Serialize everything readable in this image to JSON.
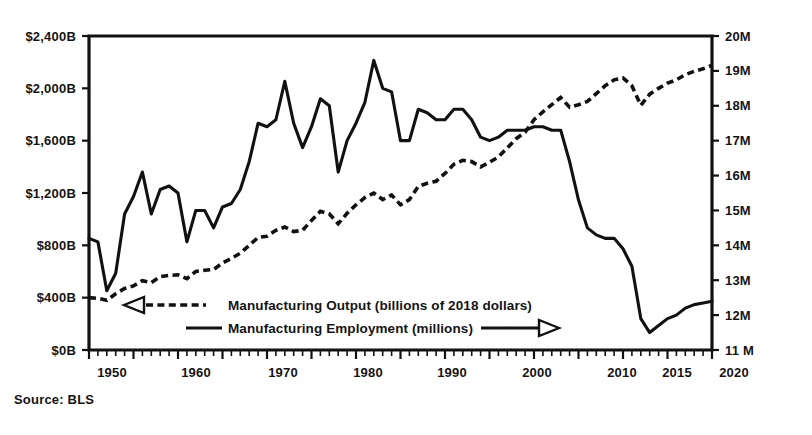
{
  "source_note": "Source: BLS",
  "legend": {
    "position": "inside-bottom-left",
    "entries": [
      {
        "label": "Manufacturing Output (billions of 2018 dollars)",
        "style": "dashed",
        "axis": "left",
        "arrow": "left"
      },
      {
        "label": "Manufacturing Employment (millions)",
        "style": "solid",
        "axis": "right",
        "arrow": "right"
      }
    ]
  },
  "axes": {
    "left": {
      "title": "",
      "ticks": [
        "$2,400B",
        "$2,000B",
        "$1,600B",
        "$1,200B",
        "$800B",
        "$400B",
        "$0B"
      ],
      "values": [
        2400,
        2000,
        1600,
        1200,
        800,
        400,
        0
      ],
      "range": [
        0,
        2400
      ]
    },
    "right": {
      "title": "",
      "ticks": [
        "20M",
        "19M",
        "18M",
        "17M",
        "16M",
        "15M",
        "14M",
        "13M",
        "12M",
        "11 M"
      ],
      "values": [
        20,
        19,
        18,
        17,
        16,
        15,
        14,
        13,
        12,
        11
      ],
      "range": [
        11,
        20
      ]
    },
    "bottom": {
      "ticks": [
        "1950",
        "1960",
        "1970",
        "1980",
        "1990",
        "2000",
        "2010",
        "2015",
        "2020"
      ],
      "values": [
        1950,
        1960,
        1970,
        1980,
        1990,
        2000,
        2010,
        2015,
        2020
      ],
      "range": [
        1947,
        2020
      ]
    }
  },
  "chart_data": {
    "type": "line",
    "title": "",
    "subtitle": "",
    "xlabel": "",
    "ylabel": "Manufacturing Output (billions of 2018 dollars)",
    "y2label": "Manufacturing Employment (millions)",
    "xlim": [
      1947,
      2020
    ],
    "ylim": [
      0,
      2400
    ],
    "y2lim": [
      11,
      20
    ],
    "grid": false,
    "legend_position": "inside-bottom-left",
    "source": "Source: BLS",
    "series": [
      {
        "name": "Manufacturing Output (billions of 2018 dollars)",
        "style": "dashed",
        "axis": "left",
        "units": "billions of 2018 dollars",
        "x": [
          1947,
          1948,
          1949,
          1950,
          1951,
          1952,
          1953,
          1954,
          1955,
          1956,
          1957,
          1958,
          1959,
          1960,
          1961,
          1962,
          1963,
          1964,
          1965,
          1966,
          1967,
          1968,
          1969,
          1970,
          1971,
          1972,
          1973,
          1974,
          1975,
          1976,
          1977,
          1978,
          1979,
          1980,
          1981,
          1982,
          1983,
          1984,
          1985,
          1986,
          1987,
          1988,
          1989,
          1990,
          1991,
          1992,
          1993,
          1994,
          1995,
          1996,
          1997,
          1998,
          1999,
          2000,
          2001,
          2002,
          2003,
          2004,
          2005,
          2006,
          2007,
          2008,
          2009,
          2010,
          2011,
          2012,
          2013,
          2014,
          2015,
          2016,
          2017
        ],
        "y": [
          400,
          395,
          380,
          430,
          470,
          490,
          530,
          515,
          560,
          570,
          575,
          545,
          600,
          610,
          615,
          665,
          700,
          740,
          800,
          860,
          870,
          915,
          940,
          905,
          915,
          990,
          1060,
          1040,
          965,
          1045,
          1110,
          1165,
          1200,
          1150,
          1185,
          1110,
          1150,
          1250,
          1275,
          1290,
          1350,
          1420,
          1450,
          1440,
          1400,
          1435,
          1475,
          1545,
          1615,
          1665,
          1760,
          1820,
          1875,
          1930,
          1855,
          1875,
          1900,
          1960,
          2020,
          2065,
          2080,
          2020,
          1870,
          1955,
          2000,
          2040,
          2065,
          2105,
          2130,
          2150,
          2175
        ]
      },
      {
        "name": "Manufacturing Employment (millions)",
        "style": "solid",
        "axis": "right",
        "units": "millions",
        "x": [
          1947,
          1948,
          1949,
          1950,
          1951,
          1952,
          1953,
          1954,
          1955,
          1956,
          1957,
          1958,
          1959,
          1960,
          1961,
          1962,
          1963,
          1964,
          1965,
          1966,
          1967,
          1968,
          1969,
          1970,
          1971,
          1972,
          1973,
          1974,
          1975,
          1976,
          1977,
          1978,
          1979,
          1980,
          1981,
          1982,
          1983,
          1984,
          1985,
          1986,
          1987,
          1988,
          1989,
          1990,
          1991,
          1992,
          1993,
          1994,
          1995,
          1996,
          1997,
          1998,
          1999,
          2000,
          2001,
          2002,
          2003,
          2004,
          2005,
          2006,
          2007,
          2008,
          2009,
          2010,
          2011,
          2012,
          2013,
          2014,
          2015,
          2016,
          2017
        ],
        "y": [
          14.2,
          14.1,
          12.7,
          13.2,
          14.9,
          15.4,
          16.1,
          14.9,
          15.6,
          15.7,
          15.5,
          14.1,
          15.0,
          15.0,
          14.5,
          15.1,
          15.2,
          15.6,
          16.4,
          17.5,
          17.4,
          17.6,
          18.7,
          17.5,
          16.8,
          17.4,
          18.2,
          18.0,
          16.1,
          17.0,
          17.5,
          18.1,
          19.3,
          18.5,
          18.4,
          17.0,
          17.0,
          17.9,
          17.8,
          17.6,
          17.6,
          17.9,
          17.9,
          17.6,
          17.1,
          17.0,
          17.1,
          17.3,
          17.3,
          17.3,
          17.4,
          17.4,
          17.3,
          17.3,
          16.4,
          15.3,
          14.5,
          14.3,
          14.2,
          14.2,
          13.9,
          13.4,
          11.9,
          11.5,
          11.7,
          11.9,
          12.0,
          12.2,
          12.3,
          12.35,
          12.4
        ]
      }
    ]
  }
}
